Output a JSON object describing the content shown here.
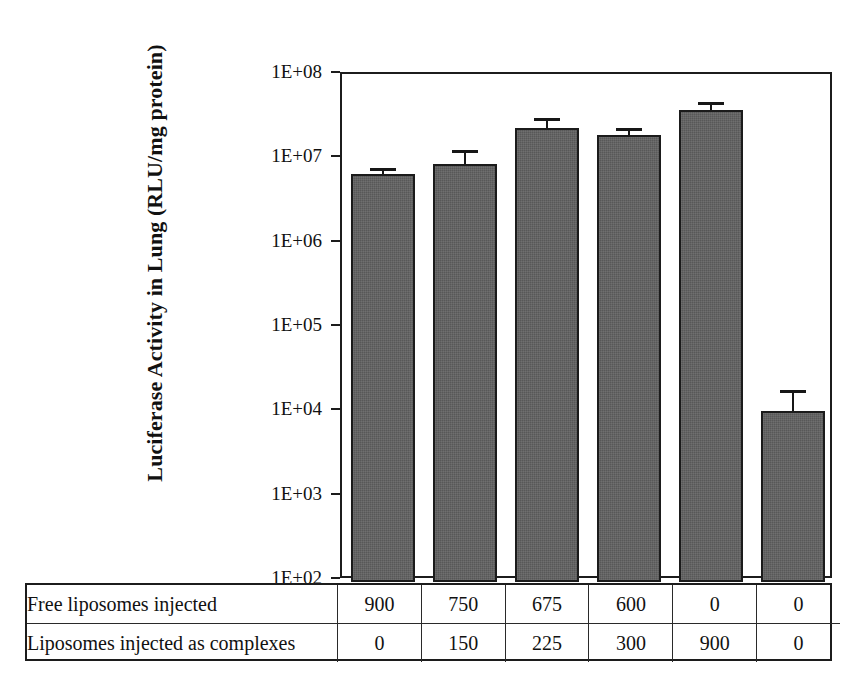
{
  "chart_data": {
    "type": "bar",
    "title": "",
    "xlabel": "",
    "ylabel": "Luciferase Activity in Lung (RLU/mg protein)",
    "yscale": "log",
    "ylim": [
      100,
      100000000
    ],
    "ytick_labels": [
      "1E+08",
      "1E+07",
      "1E+06",
      "1E+05",
      "1E+04",
      "1E+03",
      "1E+02"
    ],
    "ytick_values": [
      100000000,
      10000000,
      1000000,
      100000,
      10000,
      1000,
      100
    ],
    "grid": false,
    "legend": "none",
    "categories": [
      "1",
      "2",
      "3",
      "4",
      "5",
      "6"
    ],
    "values": [
      6500000,
      8500000,
      23000000,
      19000000,
      37000000,
      10000
    ],
    "errors_upper": [
      1200000,
      4000000,
      7000000,
      4000000,
      9000000,
      8000
    ],
    "bar_color": "#585858",
    "bar_edge_color": "#1b1b1b",
    "error_bar_color": "#171717",
    "axis_color": "#1c1c1c",
    "series": [
      {
        "name": "Luciferase Activity in Lung (RLU/mg protein)",
        "values": [
          6500000,
          8500000,
          23000000,
          19000000,
          37000000,
          10000
        ],
        "errors_upper": [
          1200000,
          4000000,
          7000000,
          4000000,
          9000000,
          8000
        ]
      }
    ]
  },
  "table": {
    "rows": [
      {
        "label": "Free liposomes injected",
        "values": [
          "900",
          "750",
          "675",
          "600",
          "0",
          "0"
        ]
      },
      {
        "label": "Liposomes injected as complexes",
        "values": [
          "0",
          "150",
          "225",
          "300",
          "900",
          "0"
        ]
      }
    ]
  }
}
